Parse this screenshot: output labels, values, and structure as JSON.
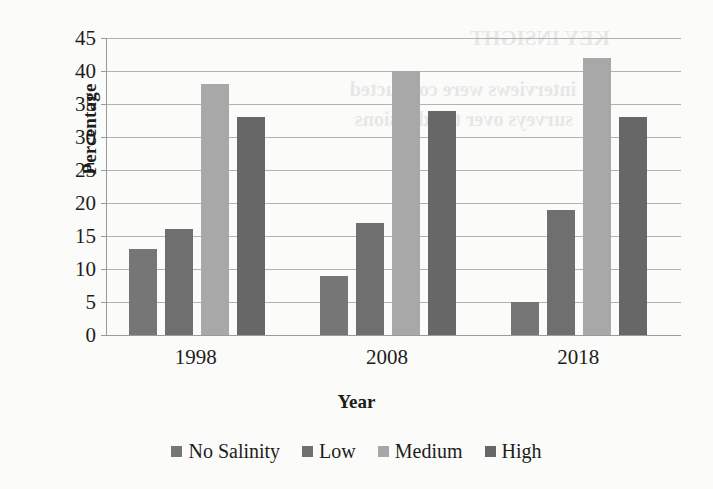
{
  "chart_data": {
    "type": "bar",
    "title": "",
    "xlabel": "Year",
    "ylabel": "Percentage",
    "categories": [
      "1998",
      "2008",
      "2018"
    ],
    "series": [
      {
        "name": "No Salinity",
        "color": "#767676",
        "values": [
          13,
          9,
          5
        ]
      },
      {
        "name": "Low",
        "color": "#6f6f6f",
        "values": [
          16,
          17,
          19
        ]
      },
      {
        "name": "Medium",
        "color": "#a8a8a8",
        "values": [
          38,
          40,
          42
        ]
      },
      {
        "name": "High",
        "color": "#676767",
        "values": [
          33,
          34,
          33
        ]
      }
    ],
    "ylim": [
      0,
      45
    ],
    "ytick_step": 5,
    "yticks": [
      0,
      5,
      10,
      15,
      20,
      25,
      30,
      35,
      40,
      45
    ],
    "grid": true,
    "legend_position": "bottom",
    "axis_color": "#9a9a98",
    "gridline_color": "#b2b2b0",
    "background_color": "#fbfbfa"
  },
  "ghost": {
    "lines": [
      "KEY INSIGHT",
      "interviews were conducted",
      "surveys over the divisions"
    ]
  }
}
